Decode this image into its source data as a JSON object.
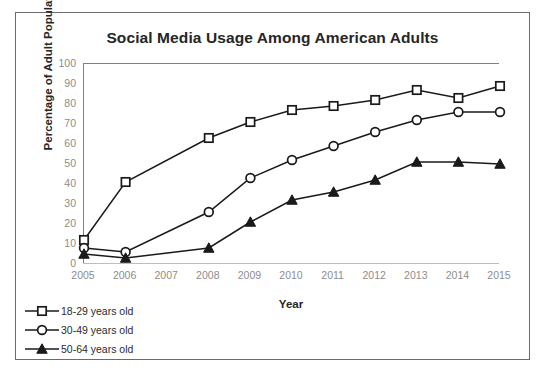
{
  "figure": {
    "title": "Social Media Usage Among American Adults"
  },
  "chart_data": {
    "type": "line",
    "title": "Social Media Usage Among American Adults",
    "xlabel": "Year",
    "ylabel": "Percentage of Adult Population",
    "x": [
      2005,
      2006,
      2007,
      2008,
      2009,
      2010,
      2011,
      2012,
      2013,
      2014,
      2015
    ],
    "xtick_labels": [
      "2005",
      "2006",
      "2007",
      "2008",
      "2009",
      "2010",
      "2011",
      "2012",
      "2013",
      "2014",
      "2015"
    ],
    "ytick_labels": [
      "0",
      "10",
      "20",
      "30",
      "40",
      "50",
      "60",
      "70",
      "80",
      "90",
      "100"
    ],
    "yticks": [
      0,
      10,
      20,
      30,
      40,
      50,
      60,
      70,
      80,
      90,
      100
    ],
    "xlim": [
      2005,
      2015
    ],
    "ylim": [
      0,
      100
    ],
    "grid": false,
    "legend_position": "below-left",
    "series": [
      {
        "name": "18-29 years old",
        "marker": "open-square",
        "color": "#1a1a1a",
        "x": [
          2005,
          2006,
          2008,
          2009,
          2010,
          2011,
          2012,
          2013,
          2014,
          2015
        ],
        "values": [
          12,
          41,
          63,
          71,
          77,
          79,
          82,
          87,
          83,
          89
        ]
      },
      {
        "name": "30-49 years old",
        "marker": "open-circle",
        "color": "#1a1a1a",
        "x": [
          2005,
          2006,
          2008,
          2009,
          2010,
          2011,
          2012,
          2013,
          2014,
          2015
        ],
        "values": [
          8,
          6,
          26,
          43,
          52,
          59,
          66,
          72,
          76,
          76
        ]
      },
      {
        "name": "50-64 years old",
        "marker": "filled-triangle",
        "color": "#1a1a1a",
        "x": [
          2005,
          2006,
          2008,
          2009,
          2010,
          2011,
          2012,
          2013,
          2014,
          2015
        ],
        "values": [
          5,
          3,
          8,
          21,
          32,
          36,
          42,
          51,
          51,
          50
        ]
      }
    ]
  },
  "legend": {
    "items": [
      {
        "label": "18-29 years old",
        "marker": "open-square"
      },
      {
        "label": "30-49 years old",
        "marker": "open-circle"
      },
      {
        "label": "50-64 years old",
        "marker": "filled-triangle"
      }
    ]
  }
}
